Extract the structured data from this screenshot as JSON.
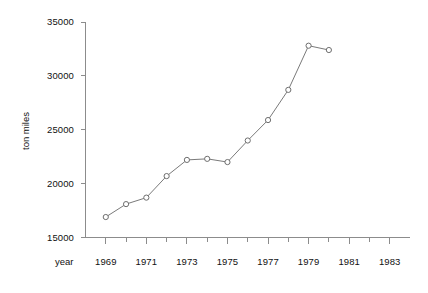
{
  "chart_data": {
    "type": "line",
    "title": "",
    "xlabel": "year",
    "ylabel": "ton miles",
    "x": [
      1969,
      1970,
      1971,
      1972,
      1973,
      1974,
      1975,
      1976,
      1977,
      1978,
      1979,
      1980
    ],
    "values": [
      16900,
      18100,
      18700,
      20700,
      22200,
      22300,
      22000,
      24000,
      25900,
      28700,
      32800,
      32400
    ],
    "series": [
      {
        "name": "ton miles",
        "values": [
          16900,
          18100,
          18700,
          20700,
          22200,
          22300,
          22000,
          24000,
          25900,
          28700,
          32800,
          32400
        ]
      }
    ],
    "xlim": [
      1968,
      1984
    ],
    "ylim": [
      15000,
      35000
    ],
    "ytick_labels": [
      "35000",
      "30000",
      "25000",
      "20000",
      "15000"
    ],
    "ytick_values": [
      35000,
      30000,
      25000,
      20000,
      15000
    ],
    "xtick_labels": [
      "1969",
      "1971",
      "1973",
      "1975",
      "1977",
      "1979",
      "1981",
      "1983"
    ],
    "xtick_values": [
      1969,
      1971,
      1973,
      1975,
      1977,
      1979,
      1981,
      1983
    ],
    "xminor_values": [
      1970,
      1972,
      1974,
      1976,
      1978,
      1980,
      1982
    ],
    "grid": false,
    "legend": "none",
    "marker": "open-circle",
    "line_color": "#7a7a7a",
    "marker_color": "#6e6e6e",
    "axis_color": "#8c8c8c",
    "background": "#ffffff"
  }
}
